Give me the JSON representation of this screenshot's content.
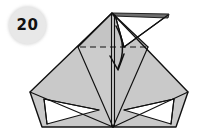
{
  "figure": {
    "kind": "origami-fold-diagram",
    "step_badge": {
      "label": "20",
      "circle_color": "#e8e8e8",
      "text_color": "#111111"
    },
    "colors": {
      "background": "#ffffff",
      "paper_front": "#c9c9c9",
      "paper_shaded": "#b6b6b6",
      "paper_dark_flap": "#6e6e6e",
      "paper_back_white": "#ffffff",
      "outline": "#111111",
      "crease_dashed": "#111111",
      "arrow": "#111111"
    },
    "model_outline": {
      "description": "Symmetric kite/bird-base shape with wide horizontal wings and a pointed top apex",
      "apex": [
        112,
        13
      ],
      "left_vertex": [
        30,
        92
      ],
      "right_vertex": [
        188,
        92
      ],
      "bottom_left": [
        42,
        127
      ],
      "bottom_right": [
        176,
        127
      ],
      "bottom_center": [
        113,
        127
      ]
    },
    "elements": [
      {
        "name": "top-dark-flap",
        "type": "folded-flap",
        "fill": "#6e6e6e",
        "note": "narrow dark strip along the top right edge"
      },
      {
        "name": "top-right-triangle-flap",
        "type": "white-underside-flap",
        "fill": "#ffffff",
        "note": "triangular flap pointing down-left from top right"
      },
      {
        "name": "valley-fold-crease",
        "type": "dashed-line",
        "style": "dashed",
        "from": [
          80,
          47
        ],
        "to": [
          145,
          47
        ]
      },
      {
        "name": "fold-arrow",
        "type": "curved-arrow",
        "direction": "down",
        "from": [
          116,
          27
        ],
        "to": [
          118,
          70
        ],
        "note": "curved arrow indicating the flap folds downward"
      },
      {
        "name": "center-vertical-crease",
        "type": "double-line",
        "from": [
          113,
          13
        ],
        "to": [
          113,
          127
        ]
      },
      {
        "name": "bottom-left-white-triangle",
        "type": "white-underside-gap",
        "fill": "#ffffff"
      },
      {
        "name": "bottom-right-white-triangle",
        "type": "white-underside-gap",
        "fill": "#ffffff"
      }
    ],
    "caption": ""
  }
}
